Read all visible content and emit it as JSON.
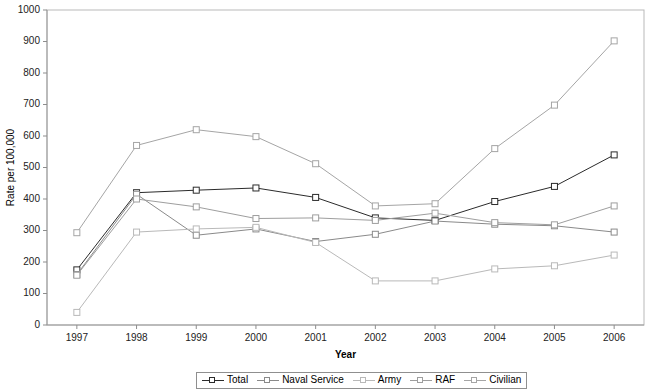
{
  "chart": {
    "title": "",
    "xlabel": "Year",
    "ylabel": "Rate per 100,000"
  },
  "legend": {
    "items": [
      {
        "label": "Total",
        "color": "#2b2b2b"
      },
      {
        "label": "Naval Service",
        "color": "#8a8a8a"
      },
      {
        "label": "Army",
        "color": "#b9b9b9"
      },
      {
        "label": "RAF",
        "color": "#9e9e9e"
      },
      {
        "label": "Civilian",
        "color": "#a5a5a5"
      }
    ]
  },
  "chart_data": {
    "type": "line",
    "title": "",
    "xlabel": "Year",
    "ylabel": "Rate per 100,000",
    "categories": [
      "1997",
      "1998",
      "1999",
      "2000",
      "2001",
      "2002",
      "2003",
      "2004",
      "2005",
      "2006"
    ],
    "x": [
      1997,
      1998,
      1999,
      2000,
      2001,
      2002,
      2003,
      2004,
      2005,
      2006
    ],
    "ylim": [
      0,
      1000
    ],
    "ytick_step": 100,
    "yticks": [
      0,
      100,
      200,
      300,
      400,
      500,
      600,
      700,
      800,
      900,
      1000
    ],
    "grid": false,
    "legend_position": "bottom",
    "marker": "open-square",
    "series": [
      {
        "name": "Total",
        "color": "#2b2b2b",
        "values": [
          175,
          420,
          428,
          435,
          405,
          340,
          332,
          392,
          440,
          540
        ]
      },
      {
        "name": "Naval Service",
        "color": "#8a8a8a",
        "values": [
          160,
          415,
          285,
          305,
          265,
          288,
          330,
          320,
          315,
          295
        ]
      },
      {
        "name": "Army",
        "color": "#b9b9b9",
        "values": [
          40,
          295,
          305,
          310,
          262,
          140,
          140,
          178,
          188,
          222
        ]
      },
      {
        "name": "RAF",
        "color": "#9e9e9e",
        "values": [
          158,
          400,
          375,
          338,
          340,
          332,
          355,
          325,
          318,
          378
        ]
      },
      {
        "name": "Civilian",
        "color": "#a5a5a5",
        "values": [
          293,
          570,
          620,
          598,
          512,
          378,
          385,
          560,
          698,
          902
        ]
      }
    ]
  },
  "axes": {
    "xtick_labels": [
      "1997",
      "1998",
      "1999",
      "2000",
      "2001",
      "2002",
      "2003",
      "2004",
      "2005",
      "2006"
    ],
    "ytick_labels": [
      "0",
      "100",
      "200",
      "300",
      "400",
      "500",
      "600",
      "700",
      "800",
      "900",
      "1000"
    ]
  }
}
